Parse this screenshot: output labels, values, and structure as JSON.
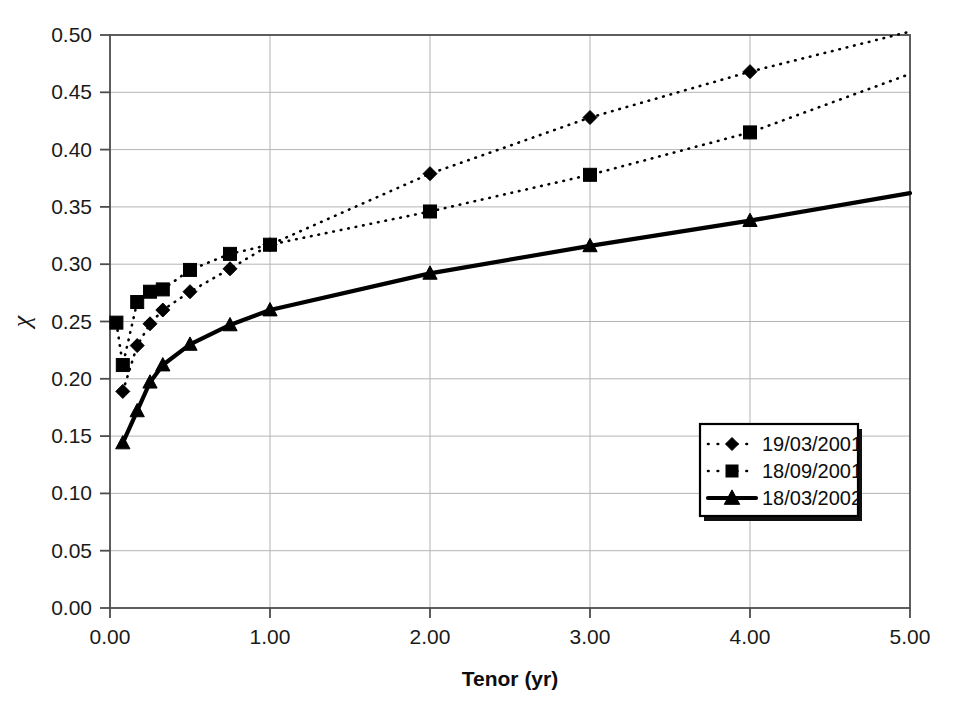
{
  "chart_data": {
    "type": "line",
    "title": "",
    "xlabel": "Tenor (yr)",
    "ylabel": "χ",
    "xlim": [
      0,
      5
    ],
    "ylim": [
      0,
      0.5
    ],
    "xticks": [
      "0.00",
      "1.00",
      "2.00",
      "3.00",
      "4.00",
      "5.00"
    ],
    "xtick_values": [
      0,
      1,
      2,
      3,
      4,
      5
    ],
    "yticks": [
      "0.00",
      "0.05",
      "0.10",
      "0.15",
      "0.20",
      "0.25",
      "0.30",
      "0.35",
      "0.40",
      "0.45",
      "0.50"
    ],
    "ytick_values": [
      0,
      0.05,
      0.1,
      0.15,
      0.2,
      0.25,
      0.3,
      0.35,
      0.4,
      0.45,
      0.5
    ],
    "grid": true,
    "grid_axis": "both",
    "legend_position": "lower right",
    "series": [
      {
        "name": "19/03/2001",
        "marker": "diamond",
        "linestyle": "dotted",
        "color": "#000000",
        "x": [
          0.08,
          0.17,
          0.25,
          0.33,
          0.5,
          0.75,
          1.0,
          2.0,
          3.0,
          4.0,
          5.0
        ],
        "y": [
          0.189,
          0.229,
          0.248,
          0.26,
          0.276,
          0.296,
          0.317,
          0.379,
          0.428,
          0.468,
          0.503
        ]
      },
      {
        "name": "18/09/2001",
        "marker": "square",
        "linestyle": "dotted",
        "color": "#000000",
        "x": [
          0.04,
          0.08,
          0.17,
          0.25,
          0.33,
          0.5,
          0.75,
          1.0,
          2.0,
          3.0,
          4.0,
          5.0
        ],
        "y": [
          0.249,
          0.212,
          0.267,
          0.276,
          0.278,
          0.295,
          0.309,
          0.317,
          0.346,
          0.378,
          0.415,
          0.466
        ]
      },
      {
        "name": "18/03/2002",
        "marker": "triangle",
        "linestyle": "solid",
        "color": "#000000",
        "x": [
          0.08,
          0.17,
          0.25,
          0.33,
          0.5,
          0.75,
          1.0,
          2.0,
          3.0,
          4.0,
          5.0
        ],
        "y": [
          0.144,
          0.172,
          0.197,
          0.212,
          0.23,
          0.247,
          0.26,
          0.292,
          0.316,
          0.338,
          0.362
        ]
      }
    ]
  },
  "legend": {
    "entries": [
      {
        "label": "19/03/2001",
        "marker": "diamond",
        "linestyle": "dotted"
      },
      {
        "label": "18/09/2001",
        "marker": "square",
        "linestyle": "dotted"
      },
      {
        "label": "18/03/2002",
        "marker": "triangle",
        "linestyle": "solid"
      }
    ]
  },
  "colors": {
    "series": "#000000",
    "grid": "#b4b4b4",
    "axis": "#4d4d4d",
    "background": "#ffffff"
  }
}
